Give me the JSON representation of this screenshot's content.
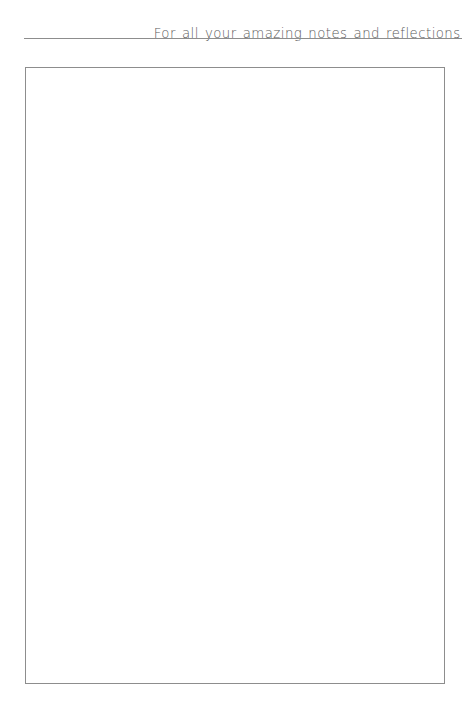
{
  "page": {
    "background_color": "#ffffff",
    "width": 469,
    "height": 706
  },
  "header": {
    "title": "For all your amazing notes and reflections",
    "text_color": "#5b5b5b",
    "align": "right"
  },
  "divider": {
    "name": "header-rule",
    "color": "#8d8d8d",
    "thickness": "1px"
  },
  "notes_box": {
    "label": "notes-writing-area",
    "content": "",
    "placeholder": "",
    "border_color": "#8d8d8d",
    "background_color": "#ffffff"
  }
}
